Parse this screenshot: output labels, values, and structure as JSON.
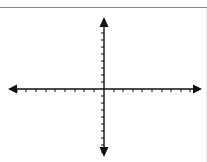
{
  "diagram": {
    "type": "coordinate-plane",
    "colors": {
      "background": "#ffffff",
      "axis": "#111111",
      "top_rule": "#8a8a8a"
    },
    "x_axis": {
      "y": 89,
      "x_start": 8,
      "x_end": 202,
      "arrows": [
        "left",
        "right"
      ],
      "ticks_left_of_origin": 9,
      "ticks_right_of_origin": 9,
      "tick_positions": [
        17,
        26,
        36,
        46,
        55,
        65,
        75,
        84,
        94,
        114,
        123,
        133,
        142,
        152,
        162,
        171,
        181,
        190
      ],
      "labels": []
    },
    "y_axis": {
      "x": 104,
      "y_start": 17,
      "y_end": 157,
      "arrows": [
        "up",
        "down"
      ],
      "ticks_above_origin": 9,
      "ticks_below_origin": 9,
      "tick_positions": [
        26,
        33,
        40,
        47,
        54,
        61,
        68,
        75,
        82,
        96,
        103,
        110,
        117,
        124,
        131,
        138,
        145,
        152
      ],
      "labels": []
    },
    "origin": {
      "x": 104,
      "y": 89
    }
  }
}
